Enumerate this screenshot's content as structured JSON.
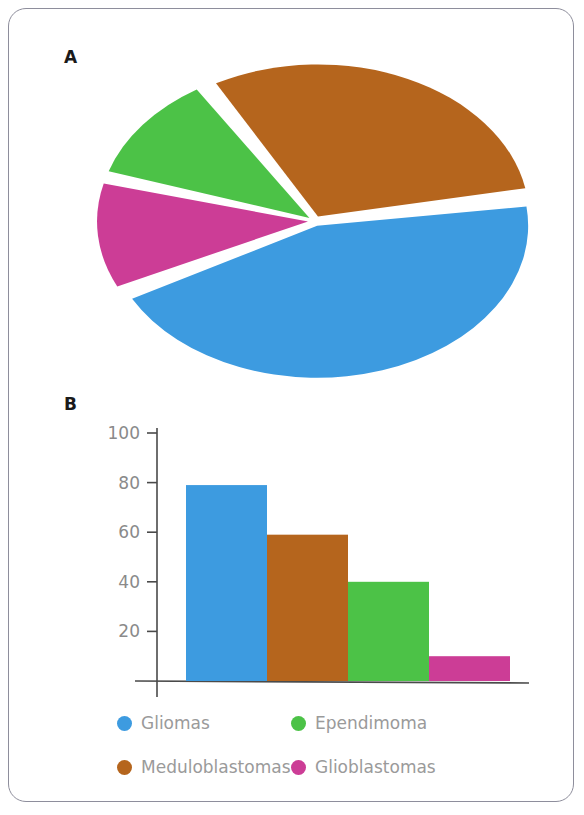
{
  "figure": {
    "panel_a_label": "A",
    "panel_b_label": "B"
  },
  "colors": {
    "gliomas": "#3d9be0",
    "meduloblastomas": "#b5651d",
    "ependimoma": "#4cc247",
    "glioblastomas": "#cc3d96",
    "axis": "#4a4a4a",
    "tick_label": "#8a8a8a",
    "legend_text": "#9a9a9a",
    "card_border": "#8e8e9c",
    "background": "#ffffff"
  },
  "legend": {
    "items": [
      {
        "label": "Gliomas",
        "color": "#3d9be0"
      },
      {
        "label": "Ependimoma",
        "color": "#4cc247"
      },
      {
        "label": "Meduloblastomas",
        "color": "#b5651d"
      },
      {
        "label": "Glioblastomas",
        "color": "#cc3d96"
      }
    ]
  },
  "chart_data": [
    {
      "type": "pie",
      "title": "A",
      "labels": [
        "Gliomas",
        "Glioblastomas",
        "Ependimoma",
        "Meduloblastomas"
      ],
      "values": [
        45,
        12,
        12,
        31
      ],
      "colors": [
        "#3d9be0",
        "#cc3d96",
        "#4cc247",
        "#b5651d"
      ],
      "exploded": true,
      "legend_position": "bottom",
      "notes": "3-D style elliptical pie with white separator gaps between slices"
    },
    {
      "type": "bar",
      "title": "B",
      "categories": [
        "Gliomas",
        "Meduloblastomas",
        "Ependimoma",
        "Glioblastomas"
      ],
      "values": [
        79,
        59,
        40,
        10
      ],
      "colors": [
        "#3d9be0",
        "#b5651d",
        "#4cc247",
        "#cc3d96"
      ],
      "xlabel": "",
      "ylabel": "",
      "ylim": [
        0,
        100
      ],
      "yticks": [
        20,
        40,
        60,
        80,
        100
      ],
      "ytick_labels": [
        "20",
        "40",
        "60",
        "80",
        "100"
      ],
      "grid": false,
      "legend_position": "bottom"
    }
  ]
}
